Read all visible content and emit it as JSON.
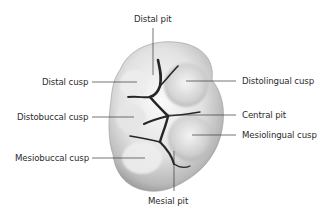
{
  "diagram": {
    "labels": [
      {
        "id": "distal-pit",
        "text": "Distal pit"
      },
      {
        "id": "distal-cusp",
        "text": "Distal cusp"
      },
      {
        "id": "distolingual-cusp",
        "text": "Distolingual cusp"
      },
      {
        "id": "distobuccal-cusp",
        "text": "Distobuccal cusp"
      },
      {
        "id": "central-pit",
        "text": "Central pit"
      },
      {
        "id": "mesiolingual-cusp",
        "text": "Mesiolingual cusp"
      },
      {
        "id": "mesiobuccal-cusp",
        "text": "Mesiobuccal cusp"
      },
      {
        "id": "mesial-pit",
        "text": "Mesial pit"
      }
    ],
    "colors": {
      "background": "#ffffff",
      "text": "#2b2b2b",
      "leader_line": "#3a3a3a",
      "tooth_light": "#f4f4f4",
      "tooth_shadow": "#8a8a8a",
      "fissure": "#2a2a2a"
    }
  }
}
